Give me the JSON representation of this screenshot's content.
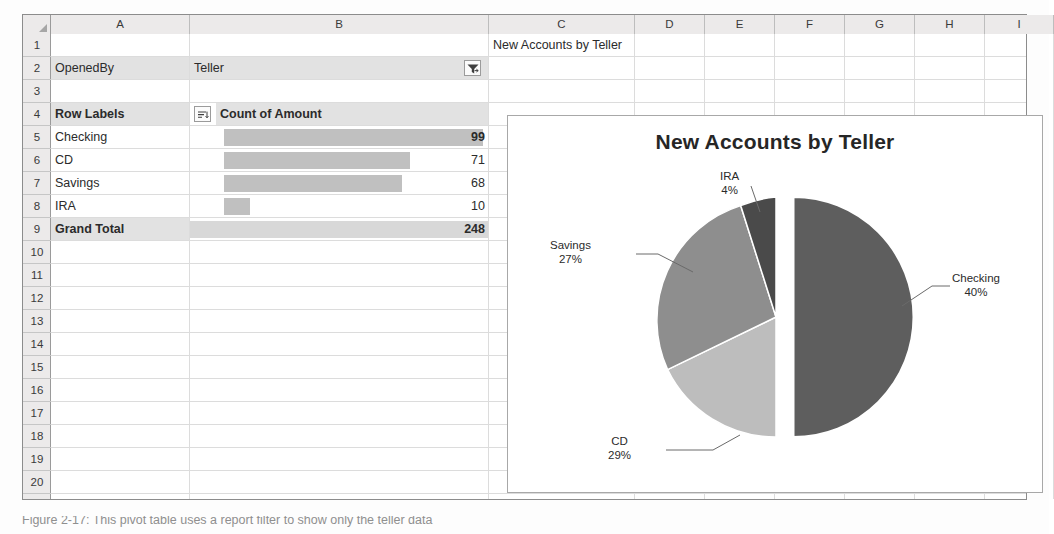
{
  "sheet": {
    "column_headers": [
      "A",
      "B",
      "C",
      "D",
      "E",
      "F",
      "G",
      "H",
      "I"
    ],
    "row_headers": [
      "1",
      "2",
      "3",
      "4",
      "5",
      "6",
      "7",
      "8",
      "9",
      "10",
      "11",
      "12",
      "13",
      "14",
      "15",
      "16",
      "17",
      "18",
      "19",
      "20"
    ],
    "cells": {
      "c1": "New Accounts by Teller",
      "a2": "OpenedBy",
      "b2": "Teller",
      "a4": "Row Labels",
      "b4": "Count of Amount",
      "grand_total_label": "Grand Total",
      "grand_total_value": "248"
    },
    "rows": [
      {
        "label": "Checking",
        "value": "99"
      },
      {
        "label": "CD",
        "value": "71"
      },
      {
        "label": "Savings",
        "value": "68"
      },
      {
        "label": "IRA",
        "value": "10"
      }
    ],
    "icons": {
      "report_filter": "filter-funnel-icon",
      "row_labels_sort": "sort-filter-icon"
    }
  },
  "chart_data": {
    "type": "pie",
    "title": "New Accounts by Teller",
    "labels": [
      "Checking",
      "CD",
      "Savings",
      "IRA"
    ],
    "values": [
      99,
      71,
      68,
      10
    ],
    "percent_labels": [
      "40%",
      "29%",
      "27%",
      "4%"
    ],
    "total": 248,
    "colors": [
      "#5e5e5e",
      "#bdbdbd",
      "#8e8e8e",
      "#4a4a4a"
    ],
    "exploded_slice": "Checking",
    "legend": "none",
    "data_labels": "category name and percentage with leader lines",
    "grid": false
  },
  "caption": {
    "text": "Figure 2-17: This pivot table uses a report filter to show only the teller data"
  }
}
